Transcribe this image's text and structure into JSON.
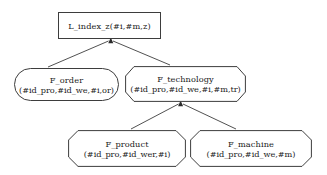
{
  "diagram": {
    "stroke_color": "#3d3d3d",
    "background_color": "#ffffff",
    "text_color": "#1a1a1a",
    "nodes": [
      {
        "id": "l_index_z",
        "shape": "rectangle",
        "name": "L_index_z(#i,#m,z)",
        "line1": "L_index_z(#i,#m,z)",
        "line2": ""
      },
      {
        "id": "f_order",
        "shape": "rounded",
        "name": "F_order",
        "line1": "F_order",
        "line2": "(#id_pro,#id_we,#i,or)"
      },
      {
        "id": "f_technology",
        "shape": "octagon",
        "name": "F_technology",
        "line1": "F_technology",
        "line2": "(#id_pro,#id_we,#i,#m,tr)"
      },
      {
        "id": "f_product",
        "shape": "octagon",
        "name": "F_product",
        "line1": "F_product",
        "line2": "(#id_pro,#id_wer,#i)"
      },
      {
        "id": "f_machine",
        "shape": "octagon",
        "name": "F_machine",
        "line1": "F_machine",
        "line2": "(#id_pro,#id_we,#m)"
      }
    ],
    "edges": [
      {
        "id": "edge-order-to-index",
        "from": "f_order",
        "to": "l_index_z",
        "arrow": "up"
      },
      {
        "id": "edge-technology-to-index",
        "from": "f_technology",
        "to": "l_index_z",
        "arrow": "up"
      },
      {
        "id": "edge-product-to-technology",
        "from": "f_product",
        "to": "f_technology",
        "arrow": "up"
      },
      {
        "id": "edge-machine-to-technology",
        "from": "f_machine",
        "to": "f_technology",
        "arrow": "up"
      }
    ]
  }
}
